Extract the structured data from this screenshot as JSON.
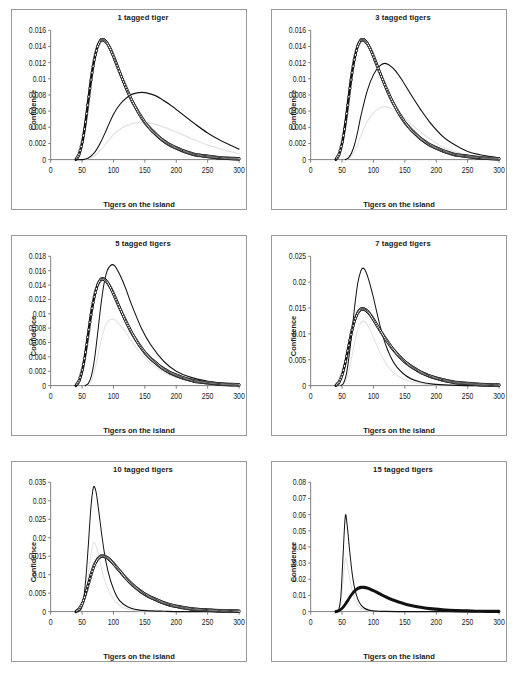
{
  "figure": {
    "panel_count": 6,
    "columns": 2,
    "rows": 3,
    "shared_xlabel": "Tigers on the island",
    "shared_ylabel": "Confidence"
  },
  "chart_data": [
    {
      "type": "line",
      "title": "1 tagged tiger",
      "xlabel": "Tigers on the island",
      "ylabel": "Confidence",
      "xlim": [
        0,
        300
      ],
      "ylim": [
        0,
        0.016
      ],
      "xticks": [
        0,
        50,
        100,
        150,
        200,
        250,
        300
      ],
      "yticks": [
        0,
        0.002,
        0.004,
        0.006,
        0.008,
        0.01,
        0.012,
        0.014,
        0.016
      ],
      "ytick_labels": [
        "0",
        "0.002",
        "0.004",
        "0.006",
        "0.008",
        "0.01",
        "0.012",
        "0.014",
        "0.016"
      ],
      "grid": false,
      "legend": "none",
      "series": [
        {
          "name": "prior",
          "style": "thick-line-with-open-circle-markers",
          "peak_x": 85,
          "peak_y": 0.0148,
          "x": [
            40,
            45,
            50,
            55,
            60,
            65,
            70,
            75,
            80,
            85,
            90,
            95,
            100,
            110,
            120,
            130,
            140,
            150,
            160,
            175,
            190,
            210,
            230,
            250,
            270,
            300
          ],
          "values": [
            0.0,
            0.0006,
            0.002,
            0.0043,
            0.0073,
            0.0103,
            0.0126,
            0.0141,
            0.0148,
            0.0148,
            0.0144,
            0.0137,
            0.0128,
            0.0108,
            0.0089,
            0.0072,
            0.0058,
            0.0046,
            0.0037,
            0.0026,
            0.0018,
            0.0011,
            0.0006,
            0.0004,
            0.0002,
            0.0001
          ]
        },
        {
          "name": "posterior",
          "style": "thin-line",
          "peak_x": 150,
          "peak_y": 0.0083,
          "x": [
            40,
            50,
            60,
            70,
            80,
            90,
            100,
            110,
            120,
            130,
            140,
            150,
            160,
            170,
            180,
            190,
            200,
            215,
            230,
            250,
            270,
            300
          ],
          "values": [
            0.0,
            0.0,
            0.0002,
            0.0009,
            0.0022,
            0.0039,
            0.0056,
            0.0068,
            0.0076,
            0.0081,
            0.0083,
            0.0083,
            0.0081,
            0.0078,
            0.0073,
            0.0068,
            0.0062,
            0.0053,
            0.0044,
            0.0033,
            0.0024,
            0.0013
          ]
        }
      ]
    },
    {
      "type": "line",
      "title": "3 tagged tigers",
      "xlabel": "Tigers on the island",
      "ylabel": "Confidence",
      "xlim": [
        0,
        300
      ],
      "ylim": [
        0,
        0.016
      ],
      "xticks": [
        0,
        50,
        100,
        150,
        200,
        250,
        300
      ],
      "yticks": [
        0,
        0.002,
        0.004,
        0.006,
        0.008,
        0.01,
        0.012,
        0.014,
        0.016
      ],
      "ytick_labels": [
        "0",
        "0.002",
        "0.004",
        "0.006",
        "0.008",
        "0.01",
        "0.012",
        "0.014",
        "0.016"
      ],
      "grid": false,
      "legend": "none",
      "series": [
        {
          "name": "prior",
          "style": "thick-line-with-open-circle-markers",
          "peak_x": 85,
          "peak_y": 0.0148,
          "x": [
            40,
            45,
            50,
            55,
            60,
            65,
            70,
            75,
            80,
            85,
            90,
            95,
            100,
            110,
            120,
            130,
            140,
            150,
            160,
            175,
            190,
            210,
            230,
            250,
            270,
            300
          ],
          "values": [
            0.0,
            0.0006,
            0.002,
            0.0043,
            0.0073,
            0.0103,
            0.0126,
            0.0141,
            0.0148,
            0.0148,
            0.0144,
            0.0137,
            0.0128,
            0.0108,
            0.0089,
            0.0072,
            0.0058,
            0.0046,
            0.0037,
            0.0026,
            0.0018,
            0.0011,
            0.0006,
            0.0004,
            0.0002,
            0.0001
          ]
        },
        {
          "name": "posterior",
          "style": "thin-line",
          "peak_x": 118,
          "peak_y": 0.0119,
          "x": [
            55,
            60,
            65,
            70,
            75,
            80,
            90,
            100,
            110,
            118,
            125,
            135,
            145,
            160,
            175,
            190,
            210,
            230,
            250,
            270,
            300
          ],
          "values": [
            0.0,
            0.0002,
            0.0008,
            0.0019,
            0.0035,
            0.0054,
            0.0085,
            0.0105,
            0.0116,
            0.0119,
            0.0117,
            0.011,
            0.0099,
            0.008,
            0.0062,
            0.0046,
            0.0029,
            0.0018,
            0.001,
            0.0006,
            0.0002
          ]
        }
      ]
    },
    {
      "type": "line",
      "title": "5 tagged tigers",
      "xlabel": "Tigers on the island",
      "ylabel": "Confidence",
      "xlim": [
        0,
        300
      ],
      "ylim": [
        0,
        0.018
      ],
      "xticks": [
        0,
        50,
        100,
        150,
        200,
        250,
        300
      ],
      "yticks": [
        0,
        0.002,
        0.004,
        0.006,
        0.008,
        0.01,
        0.012,
        0.014,
        0.016,
        0.018
      ],
      "ytick_labels": [
        "0",
        "0.002",
        "0.004",
        "0.006",
        "0.008",
        "0.01",
        "0.012",
        "0.014",
        "0.016",
        "0.018"
      ],
      "grid": false,
      "legend": "none",
      "series": [
        {
          "name": "prior",
          "style": "thick-line-with-open-circle-markers",
          "peak_x": 85,
          "peak_y": 0.0148,
          "x": [
            40,
            45,
            50,
            55,
            60,
            65,
            70,
            75,
            80,
            85,
            90,
            95,
            100,
            110,
            120,
            130,
            140,
            150,
            160,
            175,
            190,
            210,
            230,
            250,
            270,
            300
          ],
          "values": [
            0.0,
            0.0006,
            0.002,
            0.0043,
            0.0073,
            0.0103,
            0.0126,
            0.0141,
            0.0148,
            0.0148,
            0.0144,
            0.0137,
            0.0128,
            0.0108,
            0.0089,
            0.0072,
            0.0058,
            0.0046,
            0.0037,
            0.0026,
            0.0018,
            0.0011,
            0.0006,
            0.0004,
            0.0002,
            0.0001
          ]
        },
        {
          "name": "posterior",
          "style": "thin-line",
          "peak_x": 100,
          "peak_y": 0.0168,
          "x": [
            55,
            60,
            65,
            70,
            75,
            80,
            85,
            90,
            95,
            100,
            105,
            112,
            120,
            130,
            145,
            160,
            180,
            200,
            225,
            250,
            275,
            300
          ],
          "values": [
            0.0,
            0.0003,
            0.0014,
            0.0038,
            0.0074,
            0.0112,
            0.0142,
            0.016,
            0.0167,
            0.0168,
            0.0163,
            0.0151,
            0.0134,
            0.011,
            0.0079,
            0.0056,
            0.0034,
            0.002,
            0.0011,
            0.0006,
            0.0003,
            0.0001
          ]
        }
      ]
    },
    {
      "type": "line",
      "title": "7 tagged tigers",
      "xlabel": "Tigers on the island",
      "ylabel": "Confidence",
      "xlim": [
        0,
        300
      ],
      "ylim": [
        0,
        0.025
      ],
      "xticks": [
        0,
        50,
        100,
        150,
        200,
        250,
        300
      ],
      "yticks": [
        0,
        0.005,
        0.01,
        0.015,
        0.02,
        0.025
      ],
      "ytick_labels": [
        "0",
        "0.005",
        "0.01",
        "0.015",
        "0.02",
        "0.025"
      ],
      "grid": false,
      "legend": "none",
      "series": [
        {
          "name": "prior",
          "style": "thick-line-with-open-circle-markers",
          "peak_x": 85,
          "peak_y": 0.0148,
          "x": [
            40,
            45,
            50,
            55,
            60,
            65,
            70,
            75,
            80,
            85,
            90,
            95,
            100,
            110,
            120,
            130,
            140,
            150,
            160,
            175,
            190,
            210,
            230,
            250,
            270,
            300
          ],
          "values": [
            0.0,
            0.0006,
            0.002,
            0.0043,
            0.0073,
            0.0103,
            0.0126,
            0.0141,
            0.0148,
            0.0148,
            0.0144,
            0.0137,
            0.0128,
            0.0108,
            0.0089,
            0.0072,
            0.0058,
            0.0046,
            0.0037,
            0.0026,
            0.0018,
            0.0011,
            0.0006,
            0.0004,
            0.0002,
            0.0001
          ]
        },
        {
          "name": "posterior",
          "style": "thin-line",
          "peak_x": 84,
          "peak_y": 0.0227,
          "x": [
            48,
            52,
            56,
            60,
            65,
            70,
            75,
            80,
            84,
            88,
            94,
            100,
            110,
            120,
            132,
            145,
            160,
            175,
            195,
            220,
            250,
            300
          ],
          "values": [
            0.0,
            0.0004,
            0.0018,
            0.0046,
            0.0096,
            0.0152,
            0.0198,
            0.0222,
            0.0227,
            0.022,
            0.0198,
            0.017,
            0.0118,
            0.0077,
            0.0045,
            0.0026,
            0.0013,
            0.0007,
            0.0003,
            0.0001,
            0.0,
            0.0
          ]
        }
      ]
    },
    {
      "type": "line",
      "title": "10 tagged tigers",
      "xlabel": "Tigers on the island",
      "ylabel": "Confidence",
      "xlim": [
        0,
        300
      ],
      "ylim": [
        0,
        0.035
      ],
      "xticks": [
        0,
        50,
        100,
        150,
        200,
        250,
        300
      ],
      "yticks": [
        0,
        0.005,
        0.01,
        0.015,
        0.02,
        0.025,
        0.03,
        0.035
      ],
      "ytick_labels": [
        "0",
        "0.005",
        "0.01",
        "0.015",
        "0.02",
        "0.025",
        "0.03",
        "0.035"
      ],
      "grid": false,
      "legend": "none",
      "series": [
        {
          "name": "prior",
          "style": "thick-line-with-open-circle-markers",
          "peak_x": 85,
          "peak_y": 0.015,
          "x": [
            40,
            45,
            50,
            55,
            60,
            65,
            70,
            75,
            80,
            85,
            90,
            95,
            100,
            110,
            120,
            130,
            140,
            150,
            160,
            175,
            190,
            210,
            230,
            250,
            270,
            300
          ],
          "values": [
            0.0,
            0.0006,
            0.002,
            0.0044,
            0.0074,
            0.0104,
            0.0128,
            0.0143,
            0.015,
            0.015,
            0.0146,
            0.0139,
            0.013,
            0.011,
            0.009,
            0.0073,
            0.0059,
            0.0047,
            0.0038,
            0.0027,
            0.0018,
            0.0011,
            0.0006,
            0.0004,
            0.0002,
            0.0001
          ]
        },
        {
          "name": "posterior",
          "style": "thin-line",
          "peak_x": 68,
          "peak_y": 0.0336,
          "x": [
            44,
            48,
            52,
            56,
            60,
            64,
            68,
            72,
            76,
            82,
            88,
            95,
            105,
            115,
            128,
            142,
            160,
            180,
            205,
            235,
            265,
            300
          ],
          "values": [
            0.0,
            0.0006,
            0.003,
            0.0089,
            0.018,
            0.028,
            0.0336,
            0.0326,
            0.028,
            0.02,
            0.0135,
            0.0086,
            0.0042,
            0.0021,
            0.0009,
            0.0004,
            0.0002,
            0.0001,
            0.0,
            0.0,
            0.0,
            0.0
          ]
        }
      ]
    },
    {
      "type": "line",
      "title": "15 tagged tigers",
      "xlabel": "Tigers on the island",
      "ylabel": "Confidence",
      "xlim": [
        0,
        300
      ],
      "ylim": [
        0,
        0.08
      ],
      "xticks": [
        0,
        50,
        100,
        150,
        200,
        250,
        300
      ],
      "yticks": [
        0,
        0.01,
        0.02,
        0.03,
        0.04,
        0.05,
        0.06,
        0.07,
        0.08
      ],
      "ytick_labels": [
        "0",
        "0.01",
        "0.02",
        "0.03",
        "0.04",
        "0.05",
        "0.06",
        "0.07",
        "0.08"
      ],
      "grid": false,
      "legend": "none",
      "series": [
        {
          "name": "prior",
          "style": "thick-line",
          "peak_x": 85,
          "peak_y": 0.015,
          "x": [
            40,
            45,
            50,
            55,
            60,
            65,
            70,
            75,
            80,
            85,
            90,
            95,
            100,
            110,
            120,
            130,
            140,
            150,
            160,
            175,
            190,
            210,
            230,
            250,
            270,
            300
          ],
          "values": [
            0.0,
            0.0006,
            0.002,
            0.0044,
            0.0074,
            0.0104,
            0.0128,
            0.0143,
            0.015,
            0.015,
            0.0146,
            0.0139,
            0.013,
            0.011,
            0.009,
            0.0073,
            0.0059,
            0.0047,
            0.0038,
            0.0027,
            0.0018,
            0.0011,
            0.0006,
            0.0004,
            0.0002,
            0.0001
          ]
        },
        {
          "name": "posterior",
          "style": "thin-line",
          "peak_x": 55,
          "peak_y": 0.0585,
          "x": [
            42,
            45,
            48,
            51,
            55,
            58,
            62,
            66,
            70,
            75,
            80,
            86,
            93,
            100,
            110,
            122,
            138,
            160,
            190,
            230,
            265,
            300
          ],
          "values": [
            0.0,
            0.0015,
            0.009,
            0.03,
            0.0585,
            0.054,
            0.038,
            0.024,
            0.0145,
            0.0078,
            0.0042,
            0.002,
            0.0009,
            0.0004,
            0.0002,
            0.0001,
            0.0,
            0.0,
            0.0,
            0.0,
            0.0,
            0.0
          ]
        }
      ]
    }
  ]
}
